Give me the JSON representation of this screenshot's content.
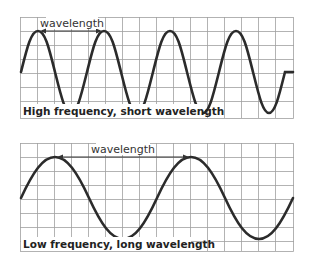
{
  "diagram": {
    "panels": [
      {
        "id": "high-frequency",
        "caption": "High frequency, short wavelength",
        "wavelength_label": "wavelength",
        "cycles_shown": 4,
        "grid": {
          "x": 20,
          "y": 17,
          "width": 274,
          "height": 102,
          "cell": 17
        }
      },
      {
        "id": "low-frequency",
        "caption": "Low frequency, long wavelength",
        "wavelength_label": "wavelength",
        "cycles_shown": 2,
        "grid": {
          "x": 20,
          "y": 143,
          "width": 274,
          "height": 109,
          "cell": 17
        }
      }
    ],
    "colors": {
      "wave": "#2b2b2b",
      "grid": "#9a9a9a",
      "arrow": "#333333",
      "text": "#222222"
    }
  }
}
